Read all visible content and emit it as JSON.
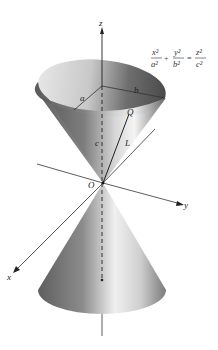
{
  "figure": {
    "type": "elliptic-cone-diagram",
    "equation": {
      "term1_num": "x²",
      "term1_den": "a²",
      "op1": "+",
      "term2_num": "y²",
      "term2_den": "b²",
      "op2": "=",
      "term3_num": "z²",
      "term3_den": "c²"
    },
    "axes": {
      "x_label": "x",
      "y_label": "y",
      "z_label": "z",
      "origin_label": "O"
    },
    "labels": {
      "semi_axis_a": "a",
      "semi_axis_b": "b",
      "height_c": "c",
      "point_q": "Q",
      "generator_l": "L"
    },
    "colors": {
      "cone_dark": "#3a3a3a",
      "cone_mid": "#8a8a8a",
      "cone_light": "#f2f2f2",
      "axis": "#333333",
      "background": "#ffffff"
    }
  }
}
